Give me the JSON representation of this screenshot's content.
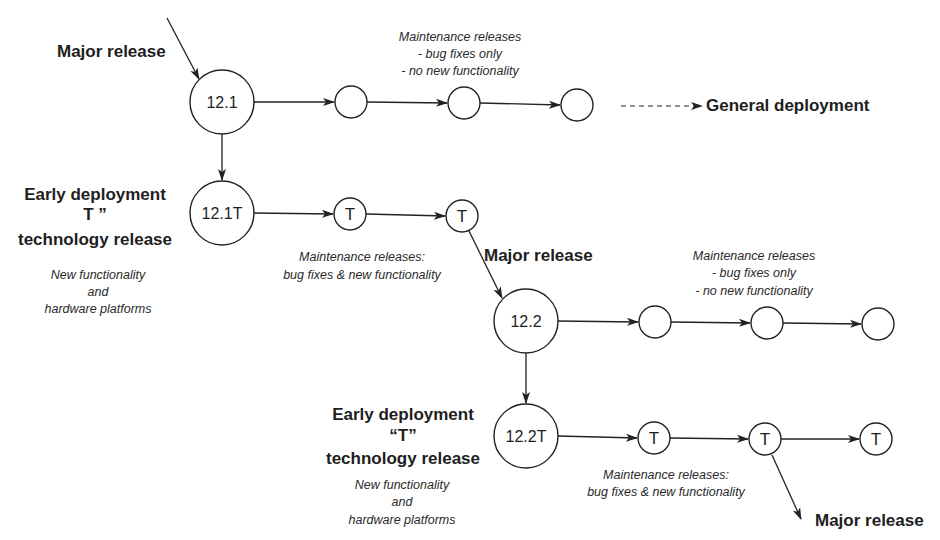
{
  "diagram": {
    "colors": {
      "stroke": "#222222",
      "text": "#1e1e1e",
      "background": "#ffffff"
    },
    "labels": {
      "major_release_1": "Major release",
      "major_release_2": "Major release",
      "major_release_3": "Major release",
      "general_deployment": "General deployment",
      "early_deployment_1": {
        "line1": "Early deployment",
        "line2": "T  ”",
        "line3": "technology release"
      },
      "early_deployment_2": {
        "line1": "Early deployment",
        "line2": "“T”",
        "line3": "technology release"
      },
      "new_functionality_1": {
        "line1": "New functionality",
        "line2": "and",
        "line3": "hardware platforms"
      },
      "new_functionality_2": {
        "line1": "New functionality",
        "line2": "and",
        "line3": "hardware platforms"
      },
      "maint_bugfix_1": {
        "line1": "Maintenance releases",
        "line2": "- bug fixes only",
        "line3": "- no new functionality"
      },
      "maint_bugfix_2": {
        "line1": "Maintenance releases",
        "line2": "- bug fixes only",
        "line3": "- no new functionality"
      },
      "maint_tech_1": {
        "line1": "Maintenance releases:",
        "line2": "bug fixes & new functionality"
      },
      "maint_tech_2": {
        "line1": "Maintenance releases:",
        "line2": "bug fixes & new functionality"
      }
    },
    "nodes": [
      {
        "id": "n12_1",
        "label": "12.1",
        "type": "major"
      },
      {
        "id": "m1a",
        "label": "",
        "type": "maintenance"
      },
      {
        "id": "m1b",
        "label": "",
        "type": "maintenance"
      },
      {
        "id": "m1c",
        "label": "",
        "type": "maintenance"
      },
      {
        "id": "n12_1T",
        "label": "12.1T",
        "type": "technology"
      },
      {
        "id": "t1a",
        "label": "T",
        "type": "technology-maintenance"
      },
      {
        "id": "t1b",
        "label": "T",
        "type": "technology-maintenance"
      },
      {
        "id": "n12_2",
        "label": "12.2",
        "type": "major"
      },
      {
        "id": "m2a",
        "label": "",
        "type": "maintenance"
      },
      {
        "id": "m2b",
        "label": "",
        "type": "maintenance"
      },
      {
        "id": "m2c",
        "label": "",
        "type": "maintenance"
      },
      {
        "id": "n12_2T",
        "label": "12.2T",
        "type": "technology"
      },
      {
        "id": "t2a",
        "label": "T",
        "type": "technology-maintenance"
      },
      {
        "id": "t2b",
        "label": "T",
        "type": "technology-maintenance"
      },
      {
        "id": "t2c",
        "label": "T",
        "type": "technology-maintenance"
      }
    ],
    "edges": [
      {
        "from": "external",
        "to": "n12_1",
        "label": "Major release"
      },
      {
        "from": "n12_1",
        "to": "m1a"
      },
      {
        "from": "m1a",
        "to": "m1b"
      },
      {
        "from": "m1b",
        "to": "m1c"
      },
      {
        "from": "m1c",
        "to": "general_deployment",
        "style": "dashed"
      },
      {
        "from": "n12_1",
        "to": "n12_1T"
      },
      {
        "from": "n12_1T",
        "to": "t1a"
      },
      {
        "from": "t1a",
        "to": "t1b"
      },
      {
        "from": "t1b",
        "to": "n12_2",
        "label": "Major release"
      },
      {
        "from": "n12_2",
        "to": "m2a"
      },
      {
        "from": "m2a",
        "to": "m2b"
      },
      {
        "from": "m2b",
        "to": "m2c"
      },
      {
        "from": "n12_2",
        "to": "n12_2T"
      },
      {
        "from": "n12_2T",
        "to": "t2a"
      },
      {
        "from": "t2a",
        "to": "t2b"
      },
      {
        "from": "t2b",
        "to": "t2c"
      },
      {
        "from": "t2b",
        "to": "external",
        "label": "Major release"
      }
    ]
  }
}
